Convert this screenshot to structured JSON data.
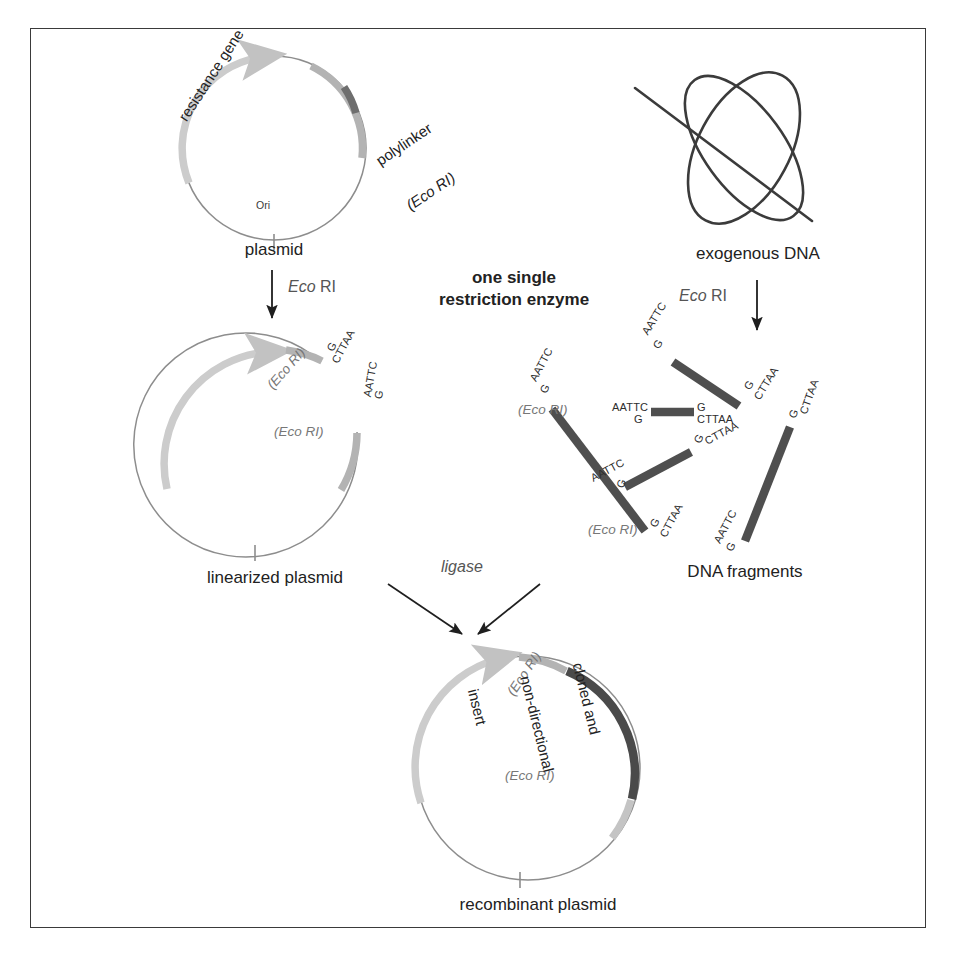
{
  "figure": {
    "title_hidden": "Cloning with one single restriction enzyme",
    "bleed_text": "",
    "frame_color": "#3a3a3a"
  },
  "colors": {
    "backbone": "#8a8a8a",
    "resistance_gene": "#c9c9c9",
    "polylinker": "#b0b0b0",
    "ecori_site_dark": "#6e6e6e",
    "insert_dark": "#4a4a4a",
    "fragment_dark": "#4f4f4f",
    "arrow": "#1f1f1f",
    "enzyme_label": "#6a6a6a"
  },
  "panels": {
    "plasmid": {
      "caption": "plasmid",
      "arc_labels": {
        "resistance_gene": "resistance gene",
        "polylinker": "polylinker",
        "polylinker_site": "(Eco RI)"
      },
      "ori_label": "Ori"
    },
    "exogenous": {
      "caption": "exogenous DNA"
    },
    "center": {
      "line1": "one single",
      "line2": "restriction enzyme"
    },
    "linearized": {
      "caption": "linearized plasmid",
      "cut_sites": [
        {
          "eco_label": "(Eco RI)",
          "top": "G",
          "bottom": "CTTAA"
        },
        {
          "eco_label": "(Eco RI)",
          "top": "AATTC",
          "bottom": "G"
        }
      ]
    },
    "fragments": {
      "caption": "DNA fragments",
      "eco_labels": [
        "(Eco RI)",
        "(Eco RI)"
      ],
      "items": [
        {
          "id": "frag-1",
          "left_end": "AATTC\nG",
          "right_end": "G\nCTTAA"
        },
        {
          "id": "frag-2",
          "left_end": "AATTC\nG",
          "right_end": "G\nCTTAA"
        },
        {
          "id": "frag-3",
          "left_end": "AATTC\nG",
          "right_end": "G\nCTTAA"
        },
        {
          "id": "frag-4",
          "left_end": "AATTC\nG",
          "right_end": "G\nCTTAA"
        },
        {
          "id": "frag-5",
          "left_end": "AATTC\nG",
          "right_end": "G\nCTTAA"
        }
      ]
    },
    "recombinant": {
      "caption": "recombinant plasmid",
      "insert_label_lines": [
        "cloned and",
        "non-directional",
        "insert"
      ],
      "cut_sites": [
        "(Eco RI)",
        "(Eco RI)"
      ]
    }
  },
  "arrows": {
    "plasmid_digest": {
      "label_italic": "Eco",
      "label_roman": " RI"
    },
    "exogenous_digest": {
      "label_italic": "Eco",
      "label_roman": " RI"
    },
    "ligation": {
      "label": "ligase"
    }
  },
  "sequences": {
    "sticky_top_g": "G",
    "sticky_top_cttaa": "CTTAA",
    "sticky_bottom_aattc": "AATTC",
    "sticky_bottom_g": "G"
  }
}
